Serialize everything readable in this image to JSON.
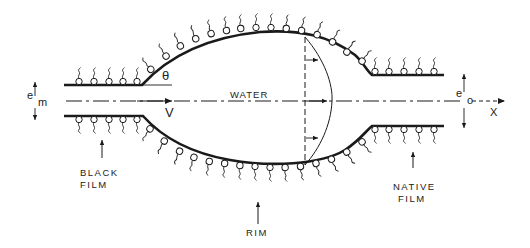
{
  "diagram": {
    "type": "cross-section schematic of a thinning liquid film (black film, rim, native film)",
    "labels": {
      "water": "WATER",
      "velocity": "V",
      "theta": "θ",
      "em_main": "e",
      "em_sub": "m",
      "eo_main": "e",
      "eo_sub": "o",
      "x_axis": "X",
      "black_film_line1": "BLACK",
      "black_film_line2": "FILM",
      "rim": "RIM",
      "native_film_line1": "NATIVE",
      "native_film_line2": "FILM"
    },
    "colors": {
      "stroke": "#1a1a1a",
      "background": "#ffffff"
    }
  }
}
